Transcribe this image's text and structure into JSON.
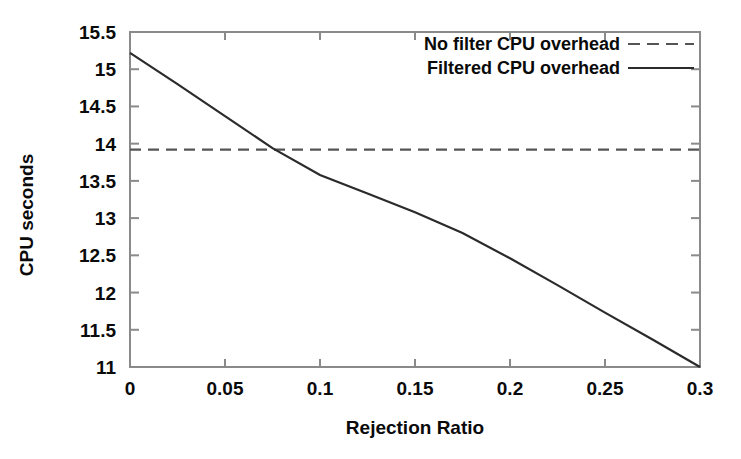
{
  "chart_data": {
    "type": "line",
    "title": "",
    "xlabel": "Rejection Ratio",
    "ylabel": "CPU seconds",
    "xlim": [
      0,
      0.3
    ],
    "ylim": [
      11,
      15.5
    ],
    "grid": false,
    "legend_position": "top-right",
    "xticks": [
      0,
      0.05,
      0.1,
      0.15,
      0.2,
      0.25,
      0.3
    ],
    "xtick_labels": [
      "0",
      "0.05",
      "0.1",
      "0.15",
      "0.2",
      "0.25",
      "0.3"
    ],
    "yticks": [
      11,
      11.5,
      12,
      12.5,
      13,
      13.5,
      14,
      14.5,
      15,
      15.5
    ],
    "ytick_labels": [
      "11",
      "11.5",
      "12",
      "12.5",
      "13",
      "13.5",
      "14",
      "14.5",
      "15",
      "15.5"
    ],
    "series": [
      {
        "name": "No filter CPU overhead",
        "style": "dashed",
        "color": "#555555",
        "x": [
          0,
          0.3
        ],
        "values": [
          13.92,
          13.92
        ]
      },
      {
        "name": "Filtered CPU overhead",
        "style": "solid",
        "color": "#2b2b2b",
        "x": [
          0,
          0.025,
          0.05,
          0.075,
          0.1,
          0.125,
          0.15,
          0.175,
          0.2,
          0.225,
          0.25,
          0.275,
          0.3
        ],
        "values": [
          15.22,
          14.8,
          14.37,
          13.94,
          13.58,
          13.33,
          13.08,
          12.8,
          12.46,
          12.1,
          11.73,
          11.37,
          11.0
        ]
      }
    ]
  },
  "legend": {
    "entries": [
      {
        "label": "No filter CPU overhead",
        "style": "dashed"
      },
      {
        "label": "Filtered CPU overhead",
        "style": "solid"
      }
    ]
  },
  "axes": {
    "x_title": "Rejection Ratio",
    "y_title": "CPU seconds"
  }
}
